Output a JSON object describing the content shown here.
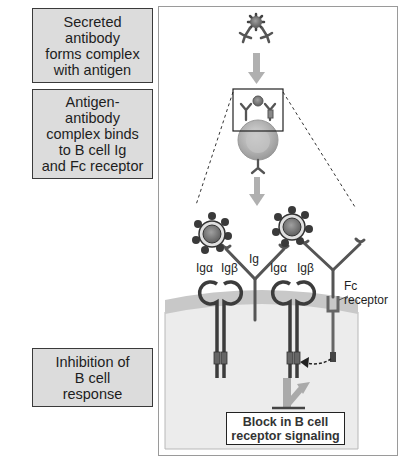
{
  "steps": [
    {
      "id": "step-1",
      "text": "Secreted\nantibody\nforms complex\nwith antigen"
    },
    {
      "id": "step-2",
      "text": "Antigen-\nantibody\ncomplex binds\nto B cell Ig\nand Fc receptor"
    },
    {
      "id": "step-3",
      "text": "Inhibition of\nB cell\nresponse"
    }
  ],
  "labels": {
    "ig": "Ig",
    "ig_alpha_1": "Igα",
    "ig_beta_1": "Igβ",
    "ig_alpha_2": "Igα",
    "ig_beta_2": "Igβ",
    "fc_receptor_line1": "Fc",
    "fc_receptor_line2": "receptor"
  },
  "outcome": {
    "text": "Block in B cell\nreceptor signaling"
  },
  "colors": {
    "box_fill": "#dcdcdc",
    "arrow": "#b0b0b0",
    "antibody": "#5a5a5a",
    "cytoplasm": "#ececec",
    "membrane": "#c8c8c8"
  }
}
